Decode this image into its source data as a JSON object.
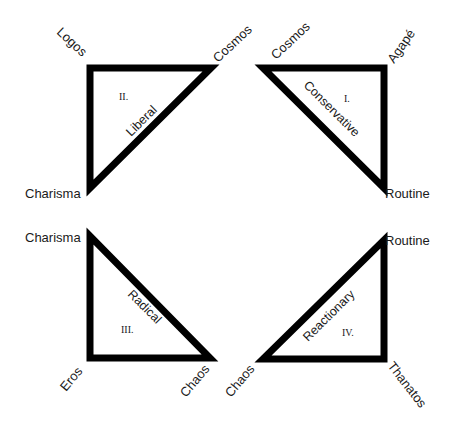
{
  "diagram": {
    "type": "four-quadrant triangle typology",
    "quadrants": [
      {
        "id": "II",
        "numeral": "II.",
        "label": "Liberal",
        "vertices": {
          "top_left": "Logos",
          "top_right": "Cosmos",
          "bottom_left": "Charisma"
        }
      },
      {
        "id": "I",
        "numeral": "I.",
        "label": "Conservative",
        "vertices": {
          "top_left": "Cosmos",
          "top_right": "Agapé",
          "bottom_right": "Routine"
        }
      },
      {
        "id": "III",
        "numeral": "III.",
        "label": "Radical",
        "vertices": {
          "top_left": "Charisma",
          "bottom_left": "Eros",
          "bottom_right": "Chaos"
        }
      },
      {
        "id": "IV",
        "numeral": "IV.",
        "label": "Reactionary",
        "vertices": {
          "top_right": "Routine",
          "bottom_left": "Chaos",
          "bottom_right": "Thanatos"
        }
      }
    ],
    "colors": {
      "stroke": "#000000",
      "fill": "#ffffff",
      "text": "#1a1a1a"
    }
  }
}
